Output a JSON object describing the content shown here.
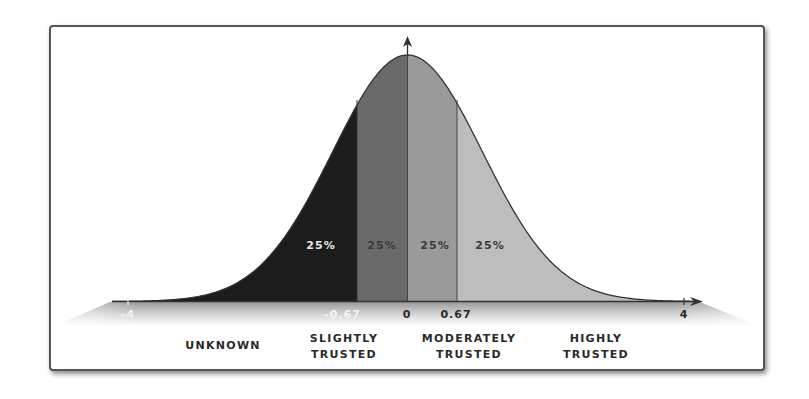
{
  "chart_data": {
    "type": "area",
    "title": "",
    "distribution": {
      "mean": 0,
      "std": 1
    },
    "x_axis": {
      "ticks": [
        "-4",
        "-0.67",
        "0",
        "0.67",
        "4"
      ],
      "range": [
        -4,
        4
      ]
    },
    "segments": [
      {
        "from": "-4",
        "to": "-0.67",
        "percent": "25%",
        "category_line1": "Unknown",
        "category_line2": "",
        "color": "#1c1c1c",
        "label_color": "#e8e8e8"
      },
      {
        "from": "-0.67",
        "to": "0",
        "percent": "25%",
        "category_line1": "Slightly",
        "category_line2": "Trusted",
        "color": "#6a6a6a",
        "label_color": "#3a3a3a"
      },
      {
        "from": "0",
        "to": "0.67",
        "percent": "25%",
        "category_line1": "Moderately",
        "category_line2": "Trusted",
        "color": "#9a9a9a",
        "label_color": "#3a3a3a"
      },
      {
        "from": "0.67",
        "to": "4",
        "percent": "25%",
        "category_line1": "Highly",
        "category_line2": "Trusted",
        "color": "#bdbdbd",
        "label_color": "#3a3a3a"
      }
    ],
    "grid": false,
    "legend": "none"
  },
  "ticks": {
    "neg4": "-4",
    "neg067": "-0.67",
    "zero": "0",
    "pos067": "0.67",
    "pos4": "4"
  },
  "percent_labels": [
    "25%",
    "25%",
    "25%",
    "25%"
  ],
  "categories": {
    "unknown": "UNKNOWN",
    "slightly_1": "SLIGHTLY",
    "slightly_2": "TRUSTED",
    "moderately_1": "MODERATELY",
    "moderately_2": "TRUSTED",
    "highly_1": "HIGHLY",
    "highly_2": "TRUSTED"
  }
}
